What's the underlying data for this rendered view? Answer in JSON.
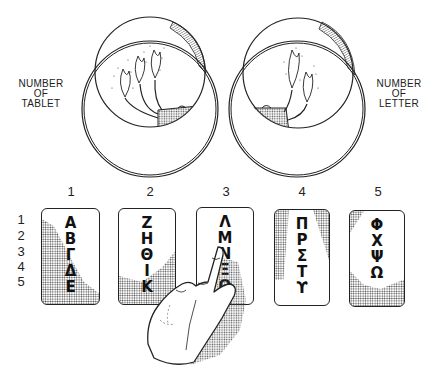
{
  "figure": {
    "left_tube_label": [
      "NUMBER",
      "OF",
      "TABLET"
    ],
    "right_tube_label": [
      "NUMBER",
      "OF",
      "LETTER"
    ],
    "left_tube_torches": 3,
    "right_tube_torches": 2
  },
  "column_numbers": [
    "1",
    "2",
    "3",
    "4",
    "5"
  ],
  "row_numbers": [
    "1",
    "2",
    "3",
    "4",
    "5"
  ],
  "tablets": [
    {
      "number": "1",
      "letters": [
        "Α",
        "Β",
        "Γ",
        "Δ",
        "Ε"
      ]
    },
    {
      "number": "2",
      "letters": [
        "Ζ",
        "Η",
        "Θ",
        "Ι",
        "Κ"
      ]
    },
    {
      "number": "3",
      "letters": [
        "Λ",
        "Μ",
        "Ν",
        "Ξ",
        "Ο"
      ]
    },
    {
      "number": "4",
      "letters": [
        "Π",
        "Ρ",
        "Σ",
        "Τ",
        "ϒ"
      ]
    },
    {
      "number": "5",
      "letters": [
        "Φ",
        "Χ",
        "Ψ",
        "Ω"
      ]
    }
  ],
  "pointing": {
    "tablet": "3",
    "letter": "Μ"
  },
  "colors": {
    "ink": "#222222",
    "background": "#ffffff",
    "stipple": "#555555"
  }
}
